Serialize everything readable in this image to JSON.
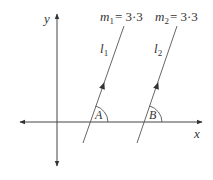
{
  "diagram": {
    "axes": {
      "x_label": "x",
      "y_label": "y"
    },
    "lines": [
      {
        "name": "l",
        "subscript": "1",
        "slope_label_var": "m",
        "slope_label_sub": "1",
        "slope_label_eq": "= 3·3",
        "angle_label": "A"
      },
      {
        "name": "l",
        "subscript": "2",
        "slope_label_var": "m",
        "slope_label_sub": "2",
        "slope_label_eq": "= 3·3",
        "angle_label": "B"
      }
    ],
    "colors": {
      "stroke": "#444444",
      "text": "#333333",
      "background": "#ffffff"
    }
  }
}
